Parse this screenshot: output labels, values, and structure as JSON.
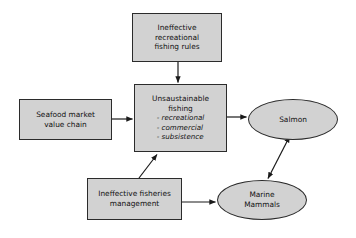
{
  "diagram": {
    "type": "causal-flow-diagram",
    "background_color": "#ffffff",
    "node_fill_color": "#d2d2d2",
    "node_border_color": "#2b2b2b",
    "text_color": "#111111",
    "nodes": [
      {
        "id": "rec-rules",
        "shape": "rectangle",
        "lines": [
          "Ineffective",
          "recreational",
          "fishing rules"
        ]
      },
      {
        "id": "seafood",
        "shape": "rectangle",
        "lines": [
          "Seafood market",
          "value chain"
        ]
      },
      {
        "id": "unsustainable",
        "shape": "rectangle",
        "lines": [
          "Unsaustainable",
          "fishing"
        ],
        "sub_items": [
          "- recreational",
          "- commercial",
          "- subsistence"
        ]
      },
      {
        "id": "fisheries-mgmt",
        "shape": "rectangle",
        "lines": [
          "Ineffective fisheries",
          "management"
        ]
      },
      {
        "id": "salmon",
        "shape": "ellipse",
        "lines": [
          "Salmon"
        ]
      },
      {
        "id": "marine-mammals",
        "shape": "ellipse",
        "lines": [
          "Marine",
          "Mammals"
        ]
      }
    ],
    "edges": [
      {
        "id": "rec-rules-to-unsustainable",
        "from": "rec-rules",
        "to": "unsustainable",
        "direction": "one-way"
      },
      {
        "id": "seafood-to-unsustainable",
        "from": "seafood",
        "to": "unsustainable",
        "direction": "one-way"
      },
      {
        "id": "fisheries-mgmt-to-unsustainable",
        "from": "fisheries-mgmt",
        "to": "unsustainable",
        "direction": "one-way"
      },
      {
        "id": "unsustainable-to-salmon",
        "from": "unsustainable",
        "to": "salmon",
        "direction": "one-way"
      },
      {
        "id": "fisheries-mgmt-to-marine-mammals",
        "from": "fisheries-mgmt",
        "to": "marine-mammals",
        "direction": "one-way"
      },
      {
        "id": "salmon-to-marine-mammals",
        "from": "salmon",
        "to": "marine-mammals",
        "direction": "two-way"
      }
    ]
  }
}
